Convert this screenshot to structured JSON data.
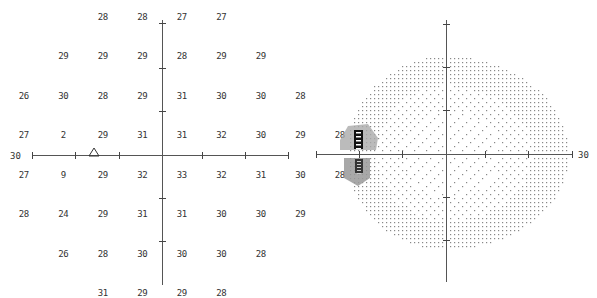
{
  "chart_data": [
    {
      "type": "table",
      "title": "Threshold values (dB)",
      "axis_label": "30",
      "xlim": [
        -30,
        30
      ],
      "ylim": [
        -30,
        30
      ],
      "grid_spacing_deg": 6,
      "rows": [
        {
          "y": 21,
          "cells": [
            {
              "x": -9,
              "v": "28"
            },
            {
              "x": -3,
              "v": "28"
            },
            {
              "x": 3,
              "v": "27"
            },
            {
              "x": 9,
              "v": "27"
            }
          ]
        },
        {
          "y": 15,
          "cells": [
            {
              "x": -15,
              "v": "29"
            },
            {
              "x": -9,
              "v": "29"
            },
            {
              "x": -3,
              "v": "29"
            },
            {
              "x": 3,
              "v": "28"
            },
            {
              "x": 9,
              "v": "29"
            },
            {
              "x": 15,
              "v": "29"
            }
          ]
        },
        {
          "y": 9,
          "cells": [
            {
              "x": -21,
              "v": "26"
            },
            {
              "x": -15,
              "v": "30"
            },
            {
              "x": -9,
              "v": "28"
            },
            {
              "x": -3,
              "v": "29"
            },
            {
              "x": 3,
              "v": "31"
            },
            {
              "x": 9,
              "v": "30"
            },
            {
              "x": 15,
              "v": "30"
            },
            {
              "x": 21,
              "v": "28"
            }
          ]
        },
        {
          "y": 3,
          "cells": [
            {
              "x": -21,
              "v": "27"
            },
            {
              "x": -15,
              "v": "2"
            },
            {
              "x": -9,
              "v": "29"
            },
            {
              "x": -3,
              "v": "31"
            },
            {
              "x": 3,
              "v": "31"
            },
            {
              "x": 9,
              "v": "32"
            },
            {
              "x": 15,
              "v": "30"
            },
            {
              "x": 21,
              "v": "29"
            },
            {
              "x": 27,
              "v": "28"
            }
          ]
        },
        {
          "y": -3,
          "cells": [
            {
              "x": -21,
              "v": "27"
            },
            {
              "x": -15,
              "v": "9"
            },
            {
              "x": -9,
              "v": "29"
            },
            {
              "x": -3,
              "v": "32"
            },
            {
              "x": 3,
              "v": "33"
            },
            {
              "x": 9,
              "v": "32"
            },
            {
              "x": 15,
              "v": "31"
            },
            {
              "x": 21,
              "v": "30"
            },
            {
              "x": 27,
              "v": "28"
            }
          ]
        },
        {
          "y": -9,
          "cells": [
            {
              "x": -21,
              "v": "28"
            },
            {
              "x": -15,
              "v": "24"
            },
            {
              "x": -9,
              "v": "29"
            },
            {
              "x": -3,
              "v": "31"
            },
            {
              "x": 3,
              "v": "31"
            },
            {
              "x": 9,
              "v": "30"
            },
            {
              "x": 15,
              "v": "30"
            },
            {
              "x": 21,
              "v": "29"
            }
          ]
        },
        {
          "y": -15,
          "cells": [
            {
              "x": -15,
              "v": "26"
            },
            {
              "x": -9,
              "v": "28"
            },
            {
              "x": -3,
              "v": "30"
            },
            {
              "x": 3,
              "v": "30"
            },
            {
              "x": 9,
              "v": "30"
            },
            {
              "x": 15,
              "v": "28"
            }
          ]
        },
        {
          "y": -21,
          "cells": [
            {
              "x": -9,
              "v": "31"
            },
            {
              "x": -3,
              "v": "29"
            },
            {
              "x": 3,
              "v": "29"
            },
            {
              "x": 9,
              "v": "28"
            }
          ]
        }
      ],
      "annotations": [
        {
          "type": "triangle",
          "label": "blind spot marker",
          "x": -15,
          "y": -1
        }
      ]
    },
    {
      "type": "heatmap",
      "title": "Greyscale map",
      "axis_label": "30",
      "xlim": [
        -30,
        30
      ],
      "ylim": [
        -30,
        30
      ],
      "description": "Dot-density greyscale; sparse dots centrally, denser peripherally; dark hatched/black region around blind spot near (-15, ±3)",
      "dark_region": {
        "x": -15,
        "y_range": [
          -9,
          6
        ],
        "levels": [
          "black",
          "dark-hatch",
          "grey",
          "light-hatch"
        ]
      }
    }
  ],
  "left": {
    "axis_label": "30",
    "values": [
      [
        "",
        "",
        "",
        "28",
        "28",
        "27",
        "27",
        "",
        "",
        ""
      ],
      [
        "",
        "",
        "29",
        "29",
        "29",
        "28",
        "29",
        "29",
        "",
        ""
      ],
      [
        "",
        "26",
        "30",
        "28",
        "29",
        "31",
        "30",
        "30",
        "28",
        ""
      ],
      [
        "",
        "27",
        "2",
        "29",
        "31",
        "31",
        "32",
        "30",
        "29",
        "28"
      ],
      [
        "",
        "27",
        "9",
        "29",
        "32",
        "33",
        "32",
        "31",
        "30",
        "28"
      ],
      [
        "",
        "28",
        "24",
        "29",
        "31",
        "31",
        "30",
        "30",
        "29",
        ""
      ],
      [
        "",
        "",
        "26",
        "28",
        "30",
        "30",
        "30",
        "28",
        "",
        ""
      ],
      [
        "",
        "",
        "",
        "31",
        "29",
        "29",
        "28",
        "",
        "",
        ""
      ]
    ]
  },
  "right": {
    "axis_label": "30"
  }
}
